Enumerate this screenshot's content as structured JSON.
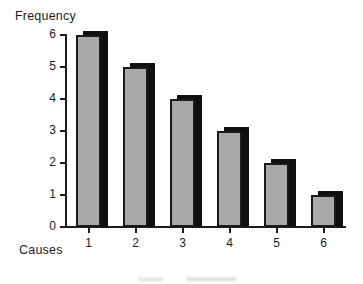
{
  "chart_data": {
    "type": "bar",
    "title": "",
    "ylabel": "Frequency",
    "xlabel": "Causes",
    "categories": [
      "1",
      "2",
      "3",
      "4",
      "5",
      "6"
    ],
    "values": [
      6,
      5,
      4,
      3,
      2,
      1
    ],
    "yticks": [
      0,
      1,
      2,
      3,
      4,
      5,
      6
    ],
    "ylim": [
      0,
      6
    ],
    "grid": false,
    "legend": "none",
    "style": {
      "bar_fill": "#a9a9a9",
      "bar_border": "#1a1a1a",
      "bar_shadow": "#0f0f0f",
      "axis_color": "#1c1c1c",
      "text_color": "#1c1c1c",
      "background": "#ffffff"
    }
  }
}
